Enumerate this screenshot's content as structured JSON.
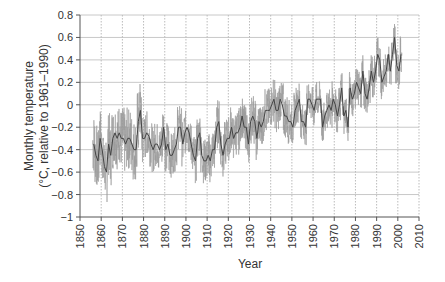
{
  "chart_data": {
    "type": "line",
    "title": "",
    "xlabel": "Year",
    "ylabel": [
      "Monthly temperature",
      "(°C, relative to 1961–1990)"
    ],
    "xlim": [
      1850,
      2010
    ],
    "ylim": [
      -1,
      0.8
    ],
    "xticks": [
      1850,
      1860,
      1870,
      1880,
      1890,
      1900,
      1910,
      1920,
      1930,
      1940,
      1950,
      1960,
      1970,
      1980,
      1990,
      2000,
      2010
    ],
    "yticks": [
      0.8,
      0.6,
      0.4,
      0.2,
      0,
      -0.2,
      -0.4,
      -0.6,
      -0.8,
      -1
    ],
    "ytick_labels": [
      "0.8",
      "0.6",
      "0.4",
      "0.2",
      "0",
      "−0.2",
      "−0.4",
      "−0.6",
      "−0.8",
      "−1"
    ],
    "grid": true,
    "legend": null,
    "series": [
      {
        "name": "Monthly temperature anomaly (approx. annual envelope)",
        "x": [
          1856,
          1857,
          1858,
          1859,
          1860,
          1861,
          1862,
          1863,
          1864,
          1865,
          1866,
          1867,
          1868,
          1869,
          1870,
          1871,
          1872,
          1873,
          1874,
          1875,
          1876,
          1877,
          1878,
          1879,
          1880,
          1881,
          1882,
          1883,
          1884,
          1885,
          1886,
          1887,
          1888,
          1889,
          1890,
          1891,
          1892,
          1893,
          1894,
          1895,
          1896,
          1897,
          1898,
          1899,
          1900,
          1901,
          1902,
          1903,
          1904,
          1905,
          1906,
          1907,
          1908,
          1909,
          1910,
          1911,
          1912,
          1913,
          1914,
          1915,
          1916,
          1917,
          1918,
          1919,
          1920,
          1921,
          1922,
          1923,
          1924,
          1925,
          1926,
          1927,
          1928,
          1929,
          1930,
          1931,
          1932,
          1933,
          1934,
          1935,
          1936,
          1937,
          1938,
          1939,
          1940,
          1941,
          1942,
          1943,
          1944,
          1945,
          1946,
          1947,
          1948,
          1949,
          1950,
          1951,
          1952,
          1953,
          1954,
          1955,
          1956,
          1957,
          1958,
          1959,
          1960,
          1961,
          1962,
          1963,
          1964,
          1965,
          1966,
          1967,
          1968,
          1969,
          1970,
          1971,
          1972,
          1973,
          1974,
          1975,
          1976,
          1977,
          1978,
          1979,
          1980,
          1981,
          1982,
          1983,
          1984,
          1985,
          1986,
          1987,
          1988,
          1989,
          1990,
          1991,
          1992,
          1993,
          1994,
          1995,
          1996,
          1997,
          1998,
          1999,
          2000,
          2001
        ],
        "values": [
          -0.35,
          -0.45,
          -0.5,
          -0.3,
          -0.4,
          -0.55,
          -0.6,
          -0.35,
          -0.45,
          -0.3,
          -0.25,
          -0.3,
          -0.25,
          -0.3,
          -0.3,
          -0.35,
          -0.3,
          -0.3,
          -0.35,
          -0.4,
          -0.4,
          -0.15,
          -0.05,
          -0.3,
          -0.3,
          -0.25,
          -0.28,
          -0.35,
          -0.4,
          -0.35,
          -0.35,
          -0.4,
          -0.35,
          -0.2,
          -0.4,
          -0.35,
          -0.45,
          -0.45,
          -0.4,
          -0.35,
          -0.2,
          -0.2,
          -0.35,
          -0.25,
          -0.2,
          -0.25,
          -0.35,
          -0.45,
          -0.5,
          -0.3,
          -0.25,
          -0.45,
          -0.5,
          -0.5,
          -0.45,
          -0.5,
          -0.4,
          -0.4,
          -0.2,
          -0.15,
          -0.35,
          -0.45,
          -0.35,
          -0.3,
          -0.3,
          -0.2,
          -0.3,
          -0.25,
          -0.25,
          -0.2,
          -0.1,
          -0.2,
          -0.2,
          -0.35,
          -0.15,
          -0.1,
          -0.15,
          -0.3,
          -0.15,
          -0.2,
          -0.15,
          -0.05,
          -0.05,
          -0.05,
          0.0,
          0.05,
          -0.05,
          -0.05,
          0.05,
          0.0,
          -0.1,
          -0.1,
          -0.15,
          -0.15,
          -0.2,
          -0.05,
          0.0,
          0.05,
          -0.15,
          -0.15,
          -0.2,
          0.05,
          0.05,
          0.0,
          -0.05,
          0.05,
          0.05,
          0.05,
          -0.2,
          -0.1,
          -0.05,
          0.0,
          -0.05,
          0.05,
          0.0,
          -0.1,
          0.0,
          0.15,
          -0.1,
          -0.05,
          -0.2,
          0.15,
          0.05,
          0.1,
          0.2,
          0.15,
          0.1,
          0.3,
          0.1,
          0.05,
          0.15,
          0.3,
          0.2,
          0.3,
          0.45,
          0.4,
          0.2,
          0.25,
          0.3,
          0.45,
          0.3,
          0.45,
          0.6,
          0.35,
          0.3,
          0.45
        ]
      }
    ],
    "notable": {
      "min": {
        "year": 1862,
        "value": -0.9
      },
      "max": {
        "year": 1998,
        "value": 0.7
      }
    }
  }
}
